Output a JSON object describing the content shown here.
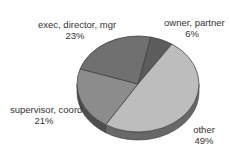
{
  "chart_data": {
    "type": "pie",
    "title": "",
    "three_d": true,
    "categories": [
      "owner, partner",
      "other",
      "supervisor, coord",
      "exec, director, mgr"
    ],
    "values": [
      6,
      49,
      21,
      23
    ],
    "labels": [
      "6%",
      "49%",
      "21%",
      "23%"
    ],
    "colors": [
      "#5c5c5c",
      "#bdbdbd",
      "#8c8c8c",
      "#707070"
    ],
    "legend": "none"
  },
  "labels": {
    "exec": {
      "name": "exec, director, mgr",
      "pct": "23%"
    },
    "owner": {
      "name": "owner, partner",
      "pct": "6%"
    },
    "supervisor": {
      "name": "supervisor, coord",
      "pct": "21%"
    },
    "other": {
      "name": "other",
      "pct": "49%"
    }
  }
}
